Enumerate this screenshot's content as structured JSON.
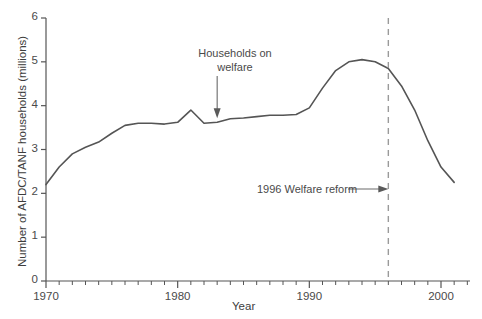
{
  "chart_data": {
    "type": "line",
    "title": "",
    "xlabel": "Year",
    "ylabel": "Number of AFDC/TANF households (millions)",
    "xlim": [
      1970,
      2002
    ],
    "ylim": [
      0,
      6
    ],
    "grid": false,
    "legend": "none",
    "x_ticks_major": [
      1970,
      1980,
      1990,
      2000
    ],
    "x_tick_labels": [
      "1970",
      "1980",
      "1990",
      "2000"
    ],
    "x_ticks_minor_step": 1,
    "y_ticks": [
      0,
      1,
      2,
      3,
      4,
      5,
      6
    ],
    "y_tick_labels": [
      "0",
      "1",
      "2",
      "3",
      "4",
      "5",
      "6"
    ],
    "series": [
      {
        "name": "Households on welfare",
        "color": "#555555",
        "x": [
          1970,
          1971,
          1972,
          1973,
          1974,
          1975,
          1976,
          1977,
          1978,
          1979,
          1980,
          1981,
          1982,
          1983,
          1984,
          1985,
          1986,
          1987,
          1988,
          1989,
          1990,
          1991,
          1992,
          1993,
          1994,
          1995,
          1996,
          1997,
          1998,
          1999,
          2000,
          2001
        ],
        "values": [
          2.2,
          2.6,
          2.9,
          3.05,
          3.17,
          3.37,
          3.55,
          3.6,
          3.6,
          3.58,
          3.62,
          3.9,
          3.6,
          3.62,
          3.7,
          3.72,
          3.75,
          3.78,
          3.78,
          3.8,
          3.95,
          4.4,
          4.8,
          5.0,
          5.05,
          5.0,
          4.85,
          4.45,
          3.9,
          3.2,
          2.6,
          2.25
        ]
      }
    ],
    "annotations": [
      {
        "name": "households-on-welfare",
        "text_line1": "Households on",
        "text_line2": "welfare",
        "arrow": "down",
        "points_to_x": 1983,
        "points_to_y": 3.62
      },
      {
        "name": "welfare-reform",
        "text": "1996 Welfare reform",
        "arrow": "right",
        "points_to_x": 1996,
        "marker": "dashed-vertical-line",
        "marker_color": "#9a9a9a"
      }
    ]
  },
  "axes": {
    "x_title": "Year",
    "y_title": "Number of AFDC/TANF households (millions)"
  }
}
